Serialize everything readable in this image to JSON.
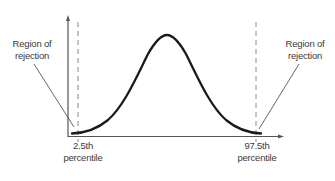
{
  "diagram": {
    "title": "",
    "type": "normal-distribution-rejection-regions",
    "left_region_label": {
      "line1": "Region of",
      "line2": "rejection"
    },
    "right_region_label": {
      "line1": "Region of",
      "line2": "rejection"
    },
    "left_cutoff_label": {
      "line1": "2.5th",
      "line2": "percentile"
    },
    "right_cutoff_label": {
      "line1": "97.5th",
      "line2": "percentile"
    },
    "colors": {
      "curve": "#1a1a1a",
      "axis": "#555555",
      "dashed": "#888888",
      "pointer": "#555555",
      "text": "#3a3a3a"
    }
  }
}
